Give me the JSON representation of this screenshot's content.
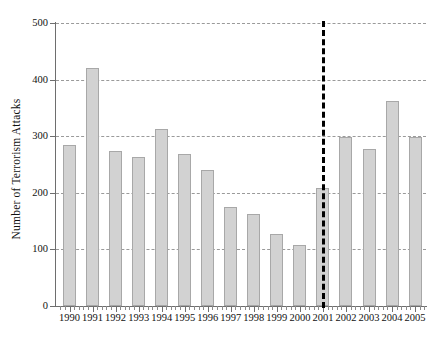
{
  "chart_data": {
    "type": "bar",
    "title": "",
    "xlabel": "",
    "ylabel": "Number of Terrorism Attacks",
    "categories": [
      "1990",
      "1991",
      "1992",
      "1993",
      "1994",
      "1995",
      "1996",
      "1997",
      "1998",
      "1999",
      "2000",
      "2001",
      "2002",
      "2003",
      "2004",
      "2005"
    ],
    "values": [
      285,
      420,
      273,
      263,
      313,
      269,
      240,
      175,
      162,
      127,
      107,
      209,
      298,
      278,
      363,
      299
    ],
    "ylim": [
      0,
      500
    ],
    "yticks": [
      0,
      100,
      200,
      300,
      400,
      500
    ],
    "ytick_labels": [
      "0",
      "100",
      "200",
      "300",
      "400",
      "500"
    ],
    "grid": "horizontal-dashed",
    "legend": "none",
    "annotations": [
      {
        "name": "september-11-marker",
        "type": "vertical-dashed-line",
        "x_category": "2001",
        "label": "",
        "color": "#000000"
      }
    ],
    "series_color": "#d2d2d2",
    "series_edge_color": "#a8a8a8",
    "gridline_color": "#9a9a9a",
    "axis_color": "#6e6e6e",
    "minor_ticks_per_interval": 4
  }
}
